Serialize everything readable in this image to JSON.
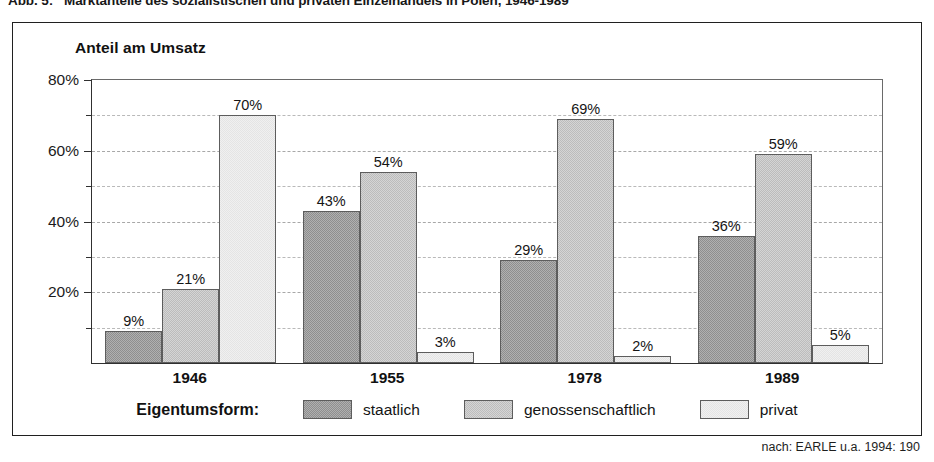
{
  "figure": {
    "caption_number": "Abb. 5:",
    "caption_text": "Marktanteile des sozialistischen und privaten Einzelhandels in Polen, 1946-1989",
    "source_note": "nach: EARLE u.a. 1994: 190"
  },
  "legend": {
    "title": "Eigentumsform:",
    "items": [
      {
        "label": "staatlich",
        "color": "#8e8e8e"
      },
      {
        "label": "genossenschaftlich",
        "color": "#bcbcbc"
      },
      {
        "label": "privat",
        "color": "#e4e4e4"
      }
    ]
  },
  "chart_data": {
    "type": "bar",
    "title": "Anteil am Umsatz",
    "xlabel": "",
    "ylabel": "",
    "ylim": [
      0,
      80
    ],
    "ytick_labels": [
      "20%",
      "40%",
      "60%",
      "80%"
    ],
    "ytick_values": [
      20,
      40,
      60,
      80
    ],
    "minor_tick_values": [
      10,
      30,
      50,
      70
    ],
    "grid": true,
    "legend_position": "bottom",
    "categories": [
      "1946",
      "1955",
      "1978",
      "1989"
    ],
    "series": [
      {
        "name": "staatlich",
        "color": "#8e8e8e",
        "values": [
          9,
          43,
          29,
          36
        ],
        "labels": [
          "9%",
          "43%",
          "29%",
          "36%"
        ]
      },
      {
        "name": "genossenschaftlich",
        "color": "#bcbcbc",
        "values": [
          21,
          54,
          69,
          59
        ],
        "labels": [
          "21%",
          "54%",
          "69%",
          "59%"
        ]
      },
      {
        "name": "privat",
        "color": "#e4e4e4",
        "values": [
          70,
          3,
          2,
          5
        ],
        "labels": [
          "70%",
          "3%",
          "2%",
          "5%"
        ]
      }
    ]
  }
}
